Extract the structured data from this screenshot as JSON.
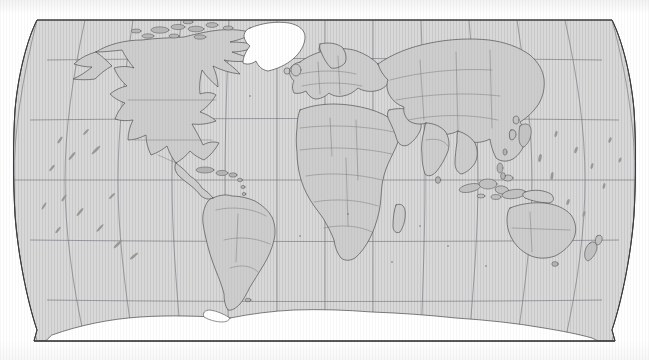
{
  "document": {
    "type": "world-map",
    "title": "World Map",
    "projection": "Robinson",
    "style": "scanned printed political outline map",
    "canvas": {
      "width": 649,
      "height": 360
    },
    "map_frame": {
      "left": 13,
      "top": 20,
      "right": 636,
      "bottom": 341
    }
  },
  "colors": {
    "background": "#ffffff",
    "land_fill": "#d3d3d3",
    "land_fill_light": "#dcdcdc",
    "unfilled_fill": "#ffffff",
    "coastline": "#4a4a4a",
    "border_line": "#6b6b6b",
    "graticule": "#70707a",
    "frame_outline": "#3c3c3c",
    "island_dot": "#9a9a9a"
  },
  "graticule": {
    "visible": true,
    "meridian_interval_degrees": 30,
    "parallel_interval_degrees": 30,
    "meridians_longitude": [
      -180,
      -150,
      -120,
      -90,
      -60,
      -30,
      0,
      30,
      60,
      90,
      120,
      150,
      180
    ],
    "parallels_latitude": [
      75,
      60,
      30,
      0,
      -30,
      -60
    ],
    "equator_latitude": 0,
    "equator_pixel_y": 180,
    "parallel_pixel_y": [
      60,
      120,
      180,
      240,
      300
    ],
    "prime_meridian_pixel_x": 325,
    "line_width_px": 0.7
  },
  "features": {
    "filled_land": "all continents and major islands",
    "white_unfilled": [
      "Greenland",
      "Antarctica"
    ],
    "country_borders_shown": true,
    "coastlines_shown": true,
    "labels_shown": false,
    "legend_shown": false,
    "scale_bar_shown": false,
    "compass_shown": false
  },
  "regions": [
    {
      "name": "North America",
      "fill": "land"
    },
    {
      "name": "Greenland",
      "fill": "white"
    },
    {
      "name": "Central America",
      "fill": "land"
    },
    {
      "name": "Caribbean",
      "fill": "land"
    },
    {
      "name": "South America",
      "fill": "land"
    },
    {
      "name": "Europe",
      "fill": "land"
    },
    {
      "name": "Africa",
      "fill": "land"
    },
    {
      "name": "Madagascar",
      "fill": "land"
    },
    {
      "name": "Asia",
      "fill": "land"
    },
    {
      "name": "Middle East",
      "fill": "land"
    },
    {
      "name": "India",
      "fill": "land"
    },
    {
      "name": "Southeast Asia",
      "fill": "land"
    },
    {
      "name": "Indonesia",
      "fill": "land"
    },
    {
      "name": "Japan",
      "fill": "land"
    },
    {
      "name": "Australia",
      "fill": "land"
    },
    {
      "name": "New Zealand",
      "fill": "land"
    },
    {
      "name": "Antarctica",
      "fill": "white"
    },
    {
      "name": "Pacific Islands",
      "fill": "land"
    },
    {
      "name": "Atlantic Islands",
      "fill": "land"
    },
    {
      "name": "Indian Ocean Islands",
      "fill": "land"
    }
  ]
}
